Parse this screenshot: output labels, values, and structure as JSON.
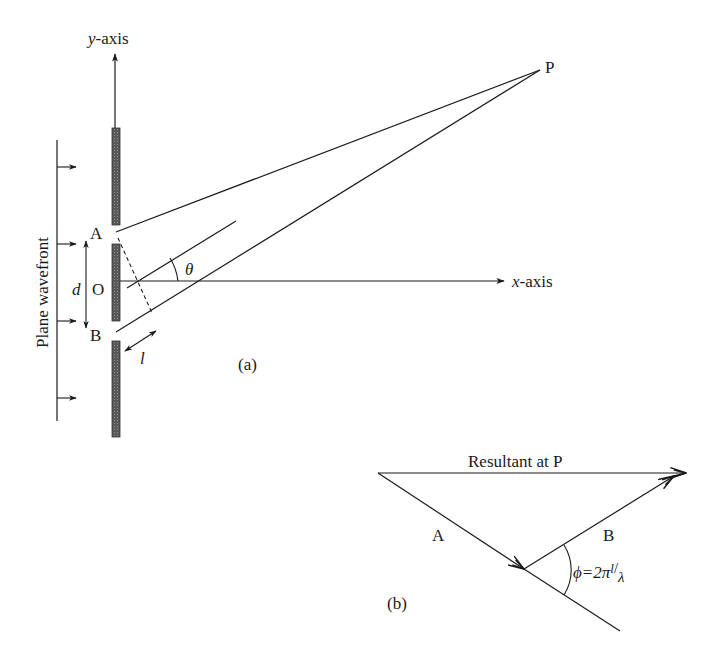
{
  "figure_a": {
    "y_axis_label_var": "y",
    "y_axis_label_rest": "-axis",
    "x_axis_label_var": "x",
    "x_axis_label_rest": "-axis",
    "wavefront_label": "Plane wavefront",
    "point_a": "A",
    "point_b": "B",
    "point_o": "O",
    "point_p": "P",
    "separation_label": "d",
    "path_difference_label": "l",
    "angle_label": "θ",
    "caption": "(a)"
  },
  "figure_b": {
    "resultant_label": "Resultant at P",
    "vector_a": "A",
    "vector_b": "B",
    "phase_label_prefix": "ϕ=2π",
    "phase_label_num": "l",
    "phase_label_slash": "/",
    "phase_label_den": "λ",
    "caption": "(b)"
  },
  "colors": {
    "line": "#1a1a1a",
    "slit_fill": "#555555"
  }
}
